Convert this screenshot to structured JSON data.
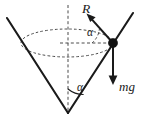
{
  "figure": {
    "background_color": "#ffffff",
    "stroke_color": "#1a1a1a",
    "dashed_color": "#4a4a4a",
    "width": 146,
    "height": 119
  },
  "labels": {
    "tension": "R",
    "weight": "mg",
    "angle_upper": "α",
    "angle_lower": "α"
  },
  "geometry": {
    "apex": {
      "x": 68,
      "y": 113
    },
    "bead": {
      "x": 113,
      "y": 43,
      "radius": 4.6
    },
    "axis": {
      "x": 68,
      "y_top": 5,
      "y_bottom": 113
    },
    "circle_path": {
      "cx": 67,
      "cy": 43,
      "rx": 46,
      "ry": 14
    },
    "cone_left_top": {
      "x": 7,
      "y": 18
    },
    "cone_right_top": {
      "x": 133,
      "y": 13
    },
    "radius_line": {
      "x1": 60,
      "y1": 43,
      "x2": 113,
      "y2": 43
    },
    "tension_vector": {
      "x1": 113,
      "y1": 43,
      "x2": 88,
      "y2": 15
    },
    "weight_vector": {
      "x1": 113,
      "y1": 43,
      "x2": 113,
      "y2": 84
    }
  },
  "annotations": {
    "tension_description": "normal-reaction-force-R",
    "weight_description": "gravitational-force-mg",
    "angle_description": "half-angle-alpha-of-cone",
    "path_description": "horizontal-circular-path-dashed-ellipse"
  }
}
